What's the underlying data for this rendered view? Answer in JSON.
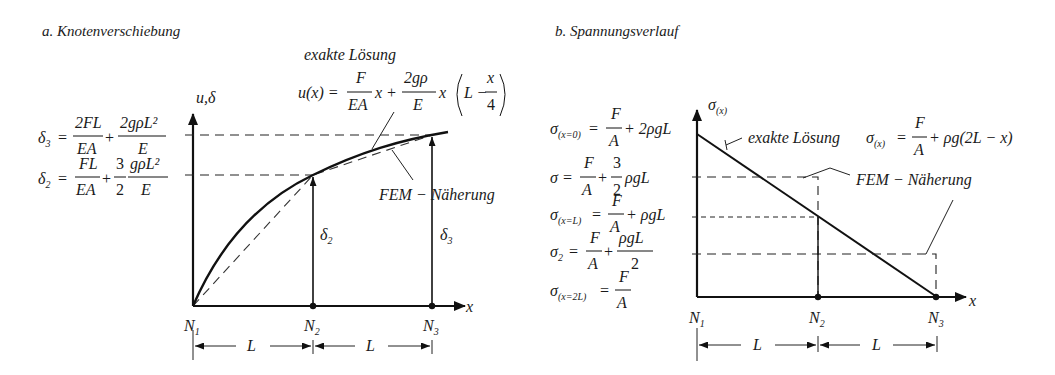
{
  "panel_a": {
    "title": "a. Knotenverschiebung",
    "y_axis_label": "u,δ",
    "x_axis_label": "x",
    "nodes": [
      "N",
      "N",
      "N"
    ],
    "node_subs": [
      "1",
      "2",
      "3"
    ],
    "span_label": "L",
    "exact_label": "exakte Lösung",
    "fem_label": "FEM − Näherung",
    "delta2_label": "δ",
    "delta2_sub": "2",
    "delta3_label": "δ",
    "delta3_sub": "3",
    "exact_formula": {
      "lhs": "u(x) =",
      "f1_num": "F",
      "f1_den": "EA",
      "t1": "x +",
      "f2_num": "2gρ",
      "f2_den": "E",
      "t2": "x",
      "paren_a": "L −",
      "f3_num": "x",
      "f3_den": "4"
    },
    "delta3_formula": {
      "lhs": "δ",
      "lhs_sub": "3",
      "eq": "=",
      "f1_num": "2FL",
      "f1_den": "EA",
      "plus": "+",
      "f2_num": "2gρL²",
      "f2_den": "E"
    },
    "delta2_formula": {
      "lhs": "δ",
      "lhs_sub": "2",
      "eq": "=",
      "f1_num": "FL",
      "f1_den": "EA",
      "plus": "+",
      "f2_num": "3",
      "f2_den": "2",
      "f3_num": "gρL²",
      "f3_den": "E"
    }
  },
  "panel_b": {
    "title": "b. Spannungsverlauf",
    "y_axis_label": "σ",
    "y_axis_sub": "(x)",
    "x_axis_label": "x",
    "nodes": [
      "N",
      "N",
      "N"
    ],
    "node_subs": [
      "1",
      "2",
      "3"
    ],
    "span_label": "L",
    "exact_label": "exakte Lösung",
    "fem_label": "FEM − Näherung",
    "exact_formula": {
      "lhs": "σ",
      "lhs_sub": "(x)",
      "eq": "=",
      "f1_num": "F",
      "f1_den": "A",
      "rest": "+ ρg(2L − x)"
    },
    "formulas": [
      {
        "lhs": "σ",
        "sub": "(x=0)",
        "eq": "=",
        "num": "F",
        "den": "A",
        "rest": "+ 2ρgL"
      },
      {
        "lhs": "σ",
        "sub": "",
        "eq": "=",
        "num": "F",
        "den": "A",
        "mid": "+",
        "num2": "3",
        "den2": "2",
        "rest": "ρgL"
      },
      {
        "lhs": "σ",
        "sub": "(x=L)",
        "eq": "=",
        "num": "F",
        "den": "A",
        "rest": "+ ρgL"
      },
      {
        "lhs": "σ",
        "sub": "2",
        "eq": "=",
        "num": "F",
        "den": "A",
        "mid": "+",
        "num2": "ρgL",
        "den2": "2",
        "rest": ""
      },
      {
        "lhs": "σ",
        "sub": "(x=2L)",
        "eq": "=",
        "num": "F",
        "den": "A",
        "rest": ""
      }
    ]
  }
}
